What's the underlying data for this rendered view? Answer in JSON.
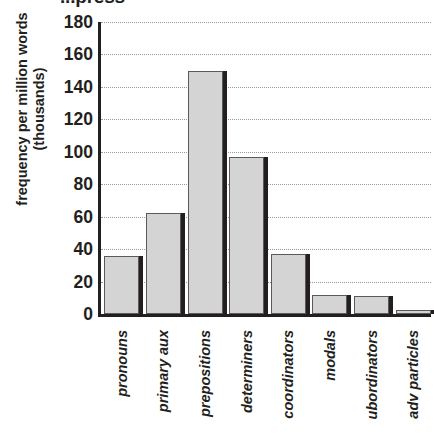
{
  "chart_data": {
    "type": "bar",
    "title": "...press",
    "title_note": "bold heading clipped by top edge of screenshot",
    "xlabel": "",
    "ylabel": "frequency per million words (thousands)",
    "categories": [
      "pronouns",
      "primary aux",
      "prepositions",
      "determiners",
      "coordinators",
      "modals",
      "ubordinators",
      "adv particles"
    ],
    "values": [
      36,
      62,
      150,
      97,
      37,
      12,
      11,
      2
    ],
    "ylim": [
      0,
      180
    ],
    "yticks": [
      0,
      20,
      40,
      60,
      80,
      100,
      120,
      140,
      160,
      180
    ],
    "ytick_labels": [
      "0",
      "20",
      "40",
      "60",
      "80",
      "100",
      "120",
      "140",
      "160",
      "180"
    ],
    "grid": true,
    "grid_style": "dotted horizontal",
    "legend": null,
    "bar_color": "#d4d4d4",
    "bar_edge_color": "#5a5a5a",
    "bar_shadow_color": "#231f20",
    "axis_color": "#231f20",
    "gridline_color": "#9a9a9a",
    "text_color": "#231f20",
    "background": "#ffffff"
  }
}
